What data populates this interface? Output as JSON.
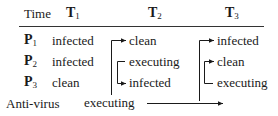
{
  "table": {
    "header": {
      "time_label": "Time",
      "columns": [
        {
          "letter": "T",
          "sub": "1"
        },
        {
          "letter": "T",
          "sub": "2"
        },
        {
          "letter": "T",
          "sub": "3"
        }
      ]
    },
    "rows": [
      {
        "label": {
          "letter": "P",
          "sub": "1"
        },
        "t1": "infected",
        "t2": "clean",
        "t3": "infected"
      },
      {
        "label": {
          "letter": "P",
          "sub": "2"
        },
        "t1": "infected",
        "t2": "executing",
        "t3": "clean"
      },
      {
        "label": {
          "letter": "P",
          "sub": "3"
        },
        "t1": "clean",
        "t2": "infected",
        "t3": "executing"
      }
    ],
    "antivirus": {
      "label": "Anti-virus",
      "state": "executing"
    }
  },
  "arrows": [
    {
      "from": "Anti-virus T1",
      "to": "P1 T2",
      "meaning": "antivirus cleans P1"
    },
    {
      "from": "P2 T2",
      "to": "P3 T2",
      "meaning": "P2 infects P3"
    },
    {
      "from": "Anti-virus T2",
      "to": "P1 T3"
    },
    {
      "from": "P2 T3 bracket",
      "to": "P2 T3 / P3 T3"
    },
    {
      "from": "Anti-virus",
      "to": "time axis right"
    }
  ],
  "colors": {
    "ink": "#1a1a1a",
    "background": "#ffffff"
  }
}
